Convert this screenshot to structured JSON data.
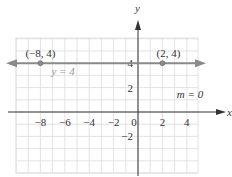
{
  "chart_data": {
    "type": "line",
    "title": "",
    "xlabel": "x",
    "ylabel": "y",
    "xlim": [
      -10,
      5
    ],
    "ylim": [
      -4,
      6
    ],
    "grid": true,
    "x_ticks": [
      -8,
      -6,
      -4,
      -2,
      0,
      2,
      4
    ],
    "y_ticks": [
      4,
      2,
      -2
    ],
    "series": [
      {
        "name": "y = 4",
        "equation": "y = 4",
        "slope": 0,
        "value": 4
      }
    ],
    "points": [
      {
        "x": -8,
        "y": 4,
        "label": "(−8, 4)"
      },
      {
        "x": 2,
        "y": 4,
        "label": "(2, 4)"
      }
    ],
    "annotations": [
      {
        "text": "y = 4",
        "position": "below line, left"
      },
      {
        "text": "m = 0",
        "position": "right, between y=2 and x-axis"
      }
    ],
    "colors": {
      "line": "#8a8a8a",
      "axis": "#333333",
      "grid": "#dcdcdc"
    }
  }
}
